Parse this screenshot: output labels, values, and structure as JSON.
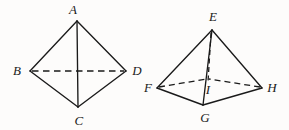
{
  "figure": {
    "kind": "geometry-diagram",
    "background_color": "#fdfcfb",
    "stroke_color": "#1a1a1a",
    "width": 289,
    "height": 130,
    "shapes": [
      {
        "name": "tetrahedron-abcd",
        "description": "Tetrahedron with apex A, base vertices B, C, D",
        "vertices": [
          {
            "label": "A",
            "x": 77,
            "y": 21,
            "label_x": 73,
            "label_y": 9
          },
          {
            "label": "B",
            "x": 30,
            "y": 71,
            "label_x": 17,
            "label_y": 70
          },
          {
            "label": "D",
            "x": 126,
            "y": 71,
            "label_x": 137,
            "label_y": 70
          },
          {
            "label": "C",
            "x": 78,
            "y": 107,
            "label_x": 79,
            "label_y": 120
          }
        ],
        "solid_edges": [
          {
            "from": "A",
            "to": "B"
          },
          {
            "from": "A",
            "to": "D"
          },
          {
            "from": "A",
            "to": "C"
          },
          {
            "from": "B",
            "to": "C"
          },
          {
            "from": "D",
            "to": "C"
          }
        ],
        "dashed_edges": [
          {
            "from": "B",
            "to": "D"
          }
        ]
      },
      {
        "name": "square-pyramid-efghi",
        "description": "Square pyramid with apex E, base corners F, G, H and hidden back corner; I marks the foot of the altitude",
        "vertices": [
          {
            "label": "E",
            "x": 212,
            "y": 30,
            "label_x": 213,
            "label_y": 16
          },
          {
            "label": "F",
            "x": 157,
            "y": 88,
            "label_x": 148,
            "label_y": 87
          },
          {
            "label": "G",
            "x": 203,
            "y": 105,
            "label_x": 205,
            "label_y": 117
          },
          {
            "label": "H",
            "x": 262,
            "y": 88,
            "label_x": 272,
            "label_y": 87
          },
          {
            "label": "I",
            "x": 208,
            "y": 80,
            "label_x": 208,
            "label_y": 89
          }
        ],
        "solid_edges": [
          {
            "from": "E",
            "to": "F"
          },
          {
            "from": "E",
            "to": "H"
          },
          {
            "from": "E",
            "to": "G"
          },
          {
            "from": "F",
            "to": "G"
          },
          {
            "from": "G",
            "to": "H"
          }
        ],
        "dashed_edges": [
          {
            "from": "F",
            "to": "BACK"
          },
          {
            "from": "H",
            "to": "BACK"
          },
          {
            "from": "E",
            "to": "BACK"
          }
        ],
        "hidden_vertex": {
          "label": "BACK",
          "x": 208,
          "y": 79
        }
      }
    ]
  }
}
